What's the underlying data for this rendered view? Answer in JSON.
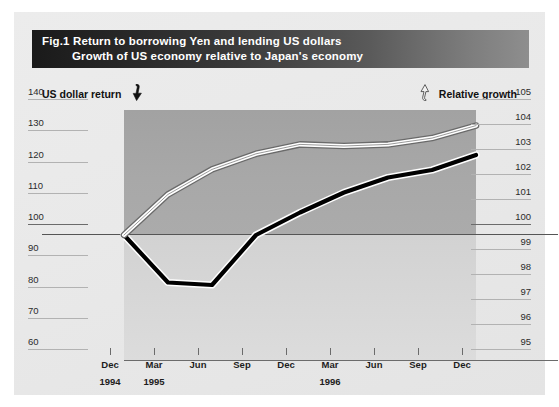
{
  "figure": {
    "title_line1_prefix": "Fig.1",
    "title_line1": "Return to borrowing Yen and lending US dollars",
    "title_line2": "Growth of US economy relative to Japan's economy"
  },
  "axes": {
    "left_caption": "US dollar return",
    "right_caption": "Relative growth",
    "left_arrow_icon": "down-arrow-black-icon",
    "right_arrow_icon": "up-arrow-white-icon"
  },
  "colors": {
    "title_bar_dark": "#1a1a1a",
    "title_bar_light": "#8e8e8e",
    "panel_bg": "#ebebeb",
    "band_upper": "#a8a8a8",
    "band_lower": "#d8d8d8",
    "line_us_dollar_return": "#ffffff",
    "line_relative_growth": "#000000",
    "axis_rule": "#6b6b6b"
  },
  "chart_data": {
    "type": "line",
    "xlabel": "",
    "ylabel": "US dollar return",
    "y2label": "Relative growth",
    "grid": false,
    "legend_position": "axis-captions",
    "x": [
      "Dec 1994",
      "Mar 1995",
      "Jun 1995",
      "Sep 1995",
      "Dec 1995",
      "Mar 1996",
      "Jun 1996",
      "Sep 1996",
      "Dec 1996"
    ],
    "xtick_labels": [
      "Dec",
      "Mar",
      "Jun",
      "Sep",
      "Dec",
      "Mar",
      "Jun",
      "Sep",
      "Dec"
    ],
    "xtick_years": [
      "1994",
      "1995",
      "",
      "",
      "",
      "1996",
      "",
      "",
      ""
    ],
    "ylim": [
      60,
      140
    ],
    "ytick_labels": [
      "140",
      "130",
      "120",
      "110",
      "100",
      "90",
      "80",
      "70",
      "60"
    ],
    "ytick_values": [
      140,
      130,
      120,
      110,
      100,
      90,
      80,
      70,
      60
    ],
    "y2lim": [
      95,
      105
    ],
    "y2tick_labels": [
      "105",
      "104",
      "103",
      "102",
      "101",
      "100",
      "99",
      "98",
      "97",
      "96",
      "95"
    ],
    "y2tick_values": [
      105,
      104,
      103,
      102,
      101,
      100,
      99,
      98,
      97,
      96,
      95
    ],
    "series": [
      {
        "name": "US dollar return",
        "axis": "left",
        "style": "white-line-with-dark-outline",
        "values": [
          100,
          113,
          121,
          126,
          129,
          128.5,
          129,
          131,
          135
        ]
      },
      {
        "name": "Relative growth",
        "axis": "right",
        "style": "black-line-with-white-outline",
        "values": [
          100,
          98.1,
          98.0,
          100,
          100.9,
          101.7,
          102.3,
          102.6,
          103.2
        ]
      }
    ]
  }
}
